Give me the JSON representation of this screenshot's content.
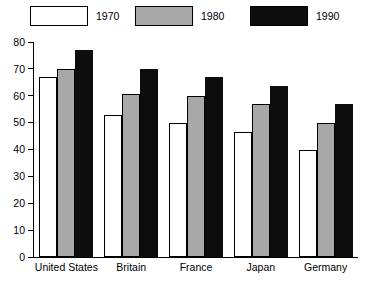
{
  "chart_data": {
    "type": "bar",
    "title": "",
    "subtitle": "",
    "xlabel": "",
    "ylabel": "",
    "categories": [
      "United States",
      "Britain",
      "France",
      "Japan",
      "Germany"
    ],
    "series": [
      {
        "name": "1970",
        "color": "#ffffff",
        "values": [
          67,
          53,
          50,
          46.5,
          40
        ]
      },
      {
        "name": "1980",
        "color": "#a8a8a8",
        "values": [
          70,
          60.5,
          60,
          57,
          50
        ]
      },
      {
        "name": "1990",
        "color": "#0d0d0d",
        "values": [
          77,
          70,
          67,
          63.5,
          57
        ]
      }
    ],
    "ylim": [
      0,
      80
    ],
    "yticks": [
      0,
      10,
      20,
      30,
      40,
      50,
      60,
      70,
      80
    ],
    "ytick_labels": [
      "0",
      "10",
      "20",
      "30",
      "40",
      "50",
      "60",
      "70",
      "80"
    ],
    "grid": false,
    "legend_position": "top",
    "legend_entries": [
      "1970",
      "1980",
      "1990"
    ]
  }
}
